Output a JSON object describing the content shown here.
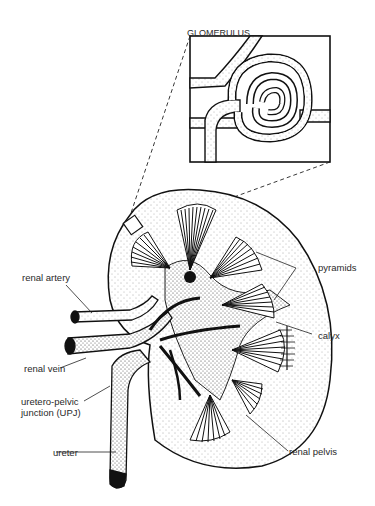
{
  "diagram": {
    "type": "anatomical-illustration",
    "inset": {
      "title": "GLOMERULUS"
    },
    "labels": [
      {
        "id": "renal-artery",
        "text": "renal artery"
      },
      {
        "id": "renal-vein",
        "text": "renal vein"
      },
      {
        "id": "upj-line1",
        "text": "uretero-pelvic"
      },
      {
        "id": "upj-line2",
        "text": "junction (UPJ)"
      },
      {
        "id": "ureter",
        "text": "ureter"
      },
      {
        "id": "pyramids",
        "text": "pyramids"
      },
      {
        "id": "calyx",
        "text": "calyx"
      },
      {
        "id": "renal-pelvis",
        "text": "renal pelvis"
      }
    ]
  }
}
